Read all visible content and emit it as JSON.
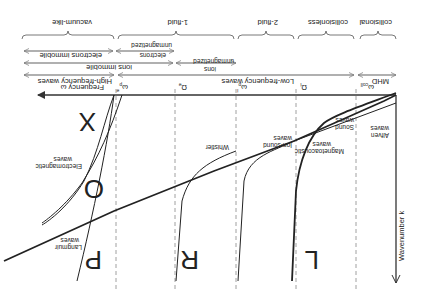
{
  "figure": {
    "orientation": "rotated-180",
    "axes": {
      "x_label": "Wavenumber  k",
      "y_label": "Frequency ω"
    },
    "frequency_markers": [
      {
        "id": "omega_coll",
        "label": "ω",
        "sub": "coll"
      },
      {
        "id": "Omega_i",
        "label": "Ω",
        "sub": "i"
      },
      {
        "id": "omega_pi",
        "label": "ω",
        "sub": "p",
        "sup": "i"
      },
      {
        "id": "Omega_e",
        "label": "Ω",
        "sub": "e"
      },
      {
        "id": "omega_pe",
        "label": "ω",
        "sub": "p",
        "sup": "e"
      }
    ],
    "regimes": {
      "row1": [
        "collisional",
        "collisionless",
        "2-fluid",
        "1-fluid",
        "vacuum-like"
      ],
      "row2_electrons": [
        "electrons unmagnetized",
        "electrons immobile"
      ],
      "row3_ions": [
        "ions unmagnetized",
        "ions immobile"
      ],
      "row4_waves": [
        "MHD",
        "Low-frequency waves",
        "High-frequency waves"
      ]
    },
    "wave_labels": {
      "alfven": "Alfven waves",
      "magnetoacoustic": "Magnetoacoustic waves",
      "sound": "Sound waves",
      "ion_sound": "Ion-sound waves",
      "whistler": "Whistler",
      "electromagnetic": "Electromagnetic waves",
      "langmuir": "Langmuir waves"
    },
    "branch_letters": [
      "L",
      "R",
      "P",
      "O",
      "X"
    ]
  },
  "colors": {
    "ink": "#222222",
    "dash": "#888888",
    "background": "#ffffff"
  }
}
